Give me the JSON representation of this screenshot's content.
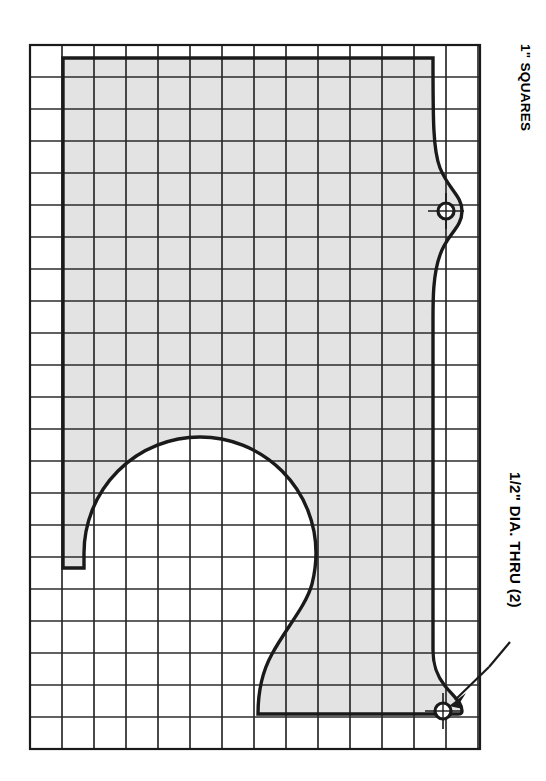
{
  "drawing": {
    "type": "mechanical-pattern-drawing",
    "title": "Gridded full-size pattern of a flat machined plate",
    "background_color": "#ffffff",
    "line_color": "#1a1a1a",
    "part_fill_color": "#e3e3e3",
    "grid": {
      "label": "1\" SQUARES",
      "cell_size_inches": 1,
      "columns": 14,
      "rows": 22,
      "cell_px": 32,
      "x_start": 30,
      "y_start": 45,
      "minor_line_width": 1.6,
      "border_line_width": 2.2
    },
    "annotations": [
      {
        "name": "grid-scale-note",
        "text": "1\" SQUARES",
        "rotation_deg": 90,
        "position": {
          "x": 533,
          "y": 44
        }
      },
      {
        "name": "hole-callout",
        "text": "1/2\" DIA. THRU (2)",
        "rotation_deg": 90,
        "position": {
          "x": 524,
          "y": 472
        },
        "leader_to": {
          "x": 452,
          "y": 700
        }
      }
    ],
    "holes": [
      {
        "name": "hole-upper",
        "cx": 446,
        "cy": 211,
        "r": 8,
        "diameter_label": "1/2\"",
        "thru": true
      },
      {
        "name": "hole-lower",
        "cx": 443,
        "cy": 711,
        "r": 8,
        "diameter_label": "1/2\"",
        "thru": true
      }
    ],
    "hole_count": 2,
    "features": {
      "top_edge_y": 58,
      "left_edge_x": 63,
      "left_edge_bottom_y": 568,
      "bottom_edge_y": 714,
      "right_edge_x": 433,
      "right_bulge_x": 462,
      "large_arc": {
        "name": "large-radius-cutout",
        "center_x": 200,
        "center_y": 565,
        "radius": 116
      }
    }
  }
}
